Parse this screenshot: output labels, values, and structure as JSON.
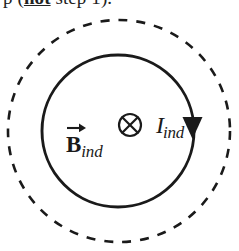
{
  "caption": {
    "prefix": "p (",
    "emphasis": "not",
    "suffix": " step 1)."
  },
  "figure": {
    "outer_dashed_circle": {
      "cx": 119,
      "cy": 131,
      "r": 111,
      "style": "dashed",
      "stroke": "#1a1a1a",
      "stroke_width": 2.6,
      "dash": "9 9"
    },
    "inner_solid_circle": {
      "cx": 118,
      "cy": 131,
      "r": 76,
      "style": "solid",
      "stroke": "#1a1a1a",
      "stroke_width": 2.8
    },
    "direction_arrowhead": {
      "x": 192,
      "y": 128,
      "points_to": "down",
      "meaning": "clockwise",
      "fill": "#1a1a1a"
    },
    "into_page_symbol": {
      "glyph": "circled-times",
      "cx": 130,
      "cy": 125,
      "r": 11,
      "stroke": "#1a1a1a",
      "stroke_width": 2.2,
      "meaning": "into the page"
    },
    "labels": {
      "b_field": {
        "base": "B",
        "subscript": "ind",
        "accent": "vector-arrow",
        "full": "B_ind"
      },
      "current": {
        "base": "I",
        "subscript": "ind",
        "full": "I_ind"
      }
    }
  },
  "colors": {
    "ink": "#1a1a1a",
    "background": "#ffffff"
  }
}
